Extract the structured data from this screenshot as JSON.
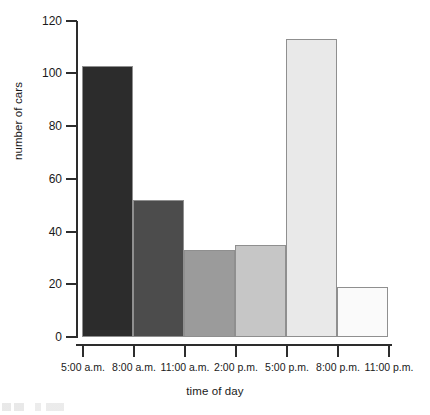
{
  "chart_data": {
    "type": "bar",
    "title": "",
    "xlabel": "time of day",
    "ylabel": "number of cars",
    "categories": [
      "5:00 a.m. - 8:00 a.m.",
      "8:00 a.m. - 11:00 a.m.",
      "11:00 a.m. - 2:00 p.m.",
      "2:00 p.m. - 5:00 p.m.",
      "5:00 p.m. - 8:00 p.m.",
      "8:00 p.m. - 11:00 p.m."
    ],
    "values": [
      103,
      52,
      33,
      35,
      113,
      19
    ],
    "bin_edges": [
      "5:00 a.m.",
      "8:00 a.m.",
      "11:00 a.m.",
      "2:00 p.m.",
      "5:00 p.m.",
      "8:00 p.m.",
      "11:00 p.m."
    ],
    "bar_colors": [
      "#2c2c2c",
      "#4c4c4c",
      "#9b9b9b",
      "#c6c6c6",
      "#e9e9e9",
      "#fafafa"
    ],
    "ylim": [
      0,
      120
    ],
    "yticks": [
      0,
      20,
      40,
      60,
      80,
      100,
      120
    ],
    "ytick_labels": [
      "0",
      "20",
      "40",
      "60",
      "80",
      "100",
      "120"
    ],
    "grid": false,
    "legend": "none",
    "axis_color": "#2d2d2d",
    "bar_border_color": "#8f8f8f"
  }
}
